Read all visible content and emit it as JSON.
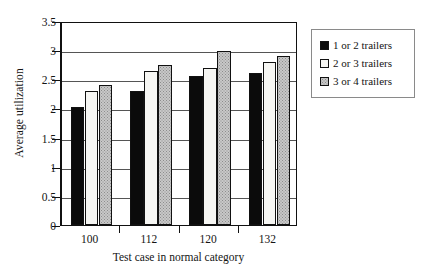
{
  "chart_data": {
    "type": "bar",
    "title": "",
    "subtitle": "",
    "xlabel": "Test case in normal category",
    "ylabel": "Average utilization",
    "categories": [
      "100",
      "112",
      "120",
      "132"
    ],
    "series": [
      {
        "name": "1 or 2 trailers",
        "color": "#0b0b0b",
        "values": [
          2.03,
          2.3,
          2.55,
          2.6
        ]
      },
      {
        "name": "2 or 3 trailers",
        "color": "#f6f6f3",
        "values": [
          2.3,
          2.65,
          2.7,
          2.79
        ]
      },
      {
        "name": "3 or 4 trailers",
        "color": "#c8c8c8",
        "values": [
          2.41,
          2.75,
          2.98,
          2.9
        ]
      }
    ],
    "ylim": [
      0,
      3.5
    ],
    "yticks": [
      "0",
      "0.5",
      "1",
      "1.5",
      "2",
      "2.5",
      "3",
      "3.5"
    ],
    "ytick_values": [
      0,
      0.5,
      1,
      1.5,
      2,
      2.5,
      3,
      3.5
    ],
    "grid": true,
    "grid_axis": "y",
    "legend_position": "right",
    "legend_entries": [
      "1 or 2 trailers",
      "2 or 3 trailers",
      "3 or 4 trailers"
    ]
  }
}
